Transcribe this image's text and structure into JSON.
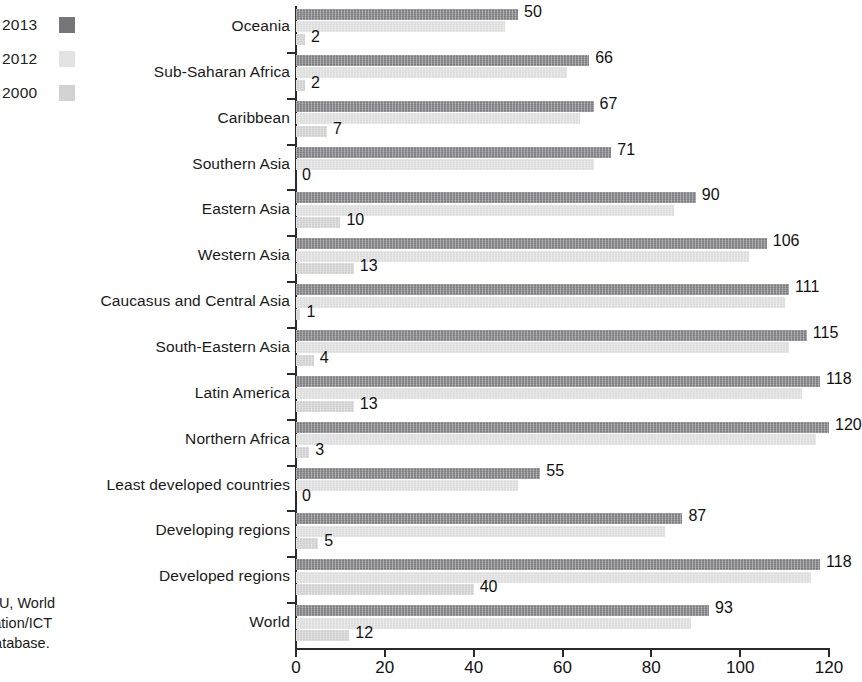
{
  "legend": {
    "items": [
      {
        "label": "2013",
        "swatch": "legend-swatch-2013",
        "color": "#75757a"
      },
      {
        "label": "2012",
        "swatch": "legend-swatch-2012",
        "color": "#e3e3e3"
      },
      {
        "label": "2000",
        "swatch": "legend-swatch-2000",
        "color": "#d2d2d2"
      }
    ]
  },
  "source": {
    "line1": "ITU, World",
    "line2": "cation/ICT",
    "line3": "database."
  },
  "chart_data": {
    "type": "bar",
    "orientation": "horizontal",
    "title": "",
    "subtitle": "",
    "xlabel": "",
    "ylabel": "",
    "xlim": [
      0,
      120
    ],
    "xticks": [
      0,
      20,
      40,
      60,
      80,
      100,
      120
    ],
    "grid": false,
    "legend_position": "top-left-outside",
    "categories": [
      "Oceania",
      "Sub-Saharan Africa",
      "Caribbean",
      "Southern Asia",
      "Eastern Asia",
      "Western Asia",
      "Caucasus and Central Asia",
      "South-Eastern Asia",
      "Latin America",
      "Northern Africa",
      "Least developed countries",
      "Developing regions",
      "Developed regions",
      "World"
    ],
    "series": [
      {
        "name": "2013",
        "color": "#7b7b80",
        "labelled": true,
        "values": [
          50,
          66,
          67,
          71,
          90,
          106,
          111,
          115,
          118,
          120,
          55,
          87,
          118,
          93
        ]
      },
      {
        "name": "2012",
        "color": "#dcdcdc",
        "labelled": false,
        "values": [
          47,
          61,
          64,
          67,
          85,
          102,
          110,
          111,
          114,
          117,
          50,
          83,
          116,
          89
        ]
      },
      {
        "name": "2000",
        "color": "#cfcfcf",
        "labelled": true,
        "values": [
          2,
          2,
          7,
          0,
          10,
          13,
          1,
          4,
          13,
          3,
          0,
          5,
          40,
          12
        ]
      }
    ]
  }
}
